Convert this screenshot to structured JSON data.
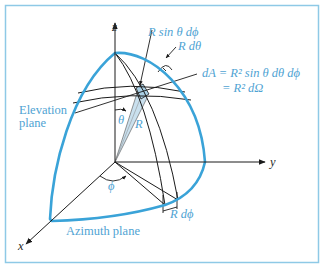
{
  "figure": {
    "type": "spherical-coordinates-differential-area",
    "frame_color": "#8ec9e6",
    "curve_color": "#3aa3d8",
    "label_color": "#4fa3d3",
    "axis_color": "#1a1a1a",
    "patch_fill": "#a9cfe4"
  },
  "axes": {
    "z": "z",
    "y": "y",
    "x": "x"
  },
  "labels": {
    "r_sin_theta_dphi": "R sin θ dϕ",
    "r_dtheta": "R dθ",
    "da_line1": "dA = R² sin θ dθ dϕ",
    "da_line2": "= R² dΩ",
    "elevation_plane_line1": "Elevation",
    "elevation_plane_line2": "plane",
    "theta": "θ",
    "radius": "R",
    "phi": "ϕ",
    "azimuth_plane": "Azimuth plane",
    "r_dphi": "R dϕ"
  }
}
